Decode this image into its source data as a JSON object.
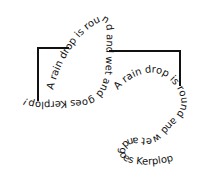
{
  "colors": {
    "ink": "#111111",
    "background": "#ffffff"
  },
  "poem_left": {
    "segments": [
      "A rain drop ",
      "is ",
      "round and ",
      "wet and goes ",
      "Kerplop!"
    ]
  },
  "poem_right": {
    "segments": [
      "A rain ",
      "drop ",
      "is ",
      "round and ",
      "wet and ",
      "goes ",
      "Kerplop!"
    ]
  },
  "brackets": [
    {
      "name": "left-bracket",
      "horizontal": {
        "x1": 38,
        "x2": 68,
        "y": 48
      },
      "vertical": {
        "x": 38,
        "y1": 48,
        "y2": 100
      }
    },
    {
      "name": "right-bracket",
      "horizontal": {
        "x1": 110,
        "x2": 180,
        "y": 51
      },
      "vertical": {
        "x": 180,
        "y1": 51,
        "y2": 85
      }
    }
  ]
}
